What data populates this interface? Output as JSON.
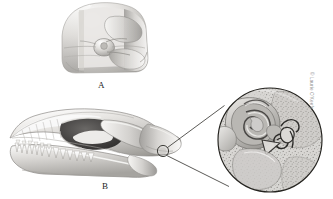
{
  "figure": {
    "type": "anatomical-illustration",
    "style": "grayscale-pencil-rendering",
    "background_color": "#ffffff",
    "panels": [
      {
        "id": "A",
        "label": "A",
        "view": "anterior coronal section of skull",
        "description": "Cut frontal view of skull showing nasal cavity, turbinates and bony septum"
      },
      {
        "id": "B",
        "label": "B",
        "view": "lateral view of skull",
        "description": "Side view of skull showing orbit, zygomatic arch, mandible and pointed tooth row, with a small circled region at the temporal bone"
      }
    ],
    "callout": {
      "target_label": "",
      "source_circle": {
        "cx": 163,
        "cy": 151,
        "r": 5.5
      },
      "magnified_circle": {
        "cx": 270,
        "cy": 140,
        "r": 52
      },
      "description": "Magnified detail of the middle and inner ear showing cochlea, auditory ossicles and trabecular bone"
    },
    "credit": "© Laurie O'Keefe",
    "colors": {
      "outline": "#2b2b2b",
      "bone_light": "#f2f1ef",
      "bone_mid": "#c9c7c4",
      "bone_shadow": "#8f8d8a",
      "bone_dark": "#5c5a58",
      "cavity_dark": "#3c3b3a",
      "label_text": "#1c1c1c",
      "credit_text": "#8d8d8d"
    }
  }
}
